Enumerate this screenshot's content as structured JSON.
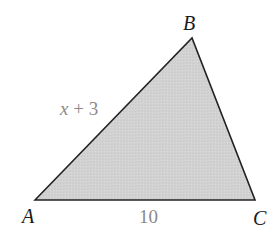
{
  "diagram": {
    "type": "triangle",
    "fill_color": "#d3d3d3",
    "stroke_color": "#222222",
    "vertices": [
      {
        "name": "A",
        "x": 35,
        "y": 200
      },
      {
        "name": "B",
        "x": 192,
        "y": 38
      },
      {
        "name": "C",
        "x": 255,
        "y": 200
      }
    ],
    "vertex_labels": {
      "A": "A",
      "B": "B",
      "C": "C"
    },
    "side_labels": {
      "AB_var": "x",
      "AB_op": " + 3",
      "AC": "10"
    }
  }
}
